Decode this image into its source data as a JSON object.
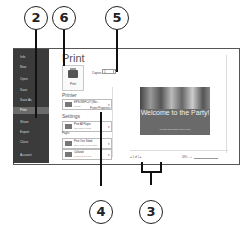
{
  "backstage": {
    "sidebar": {
      "items": [
        {
          "label": "Info",
          "active": false
        },
        {
          "label": "New",
          "active": false
        },
        {
          "label": "Open",
          "active": false
        },
        {
          "label": "Save",
          "active": false
        },
        {
          "label": "Save As",
          "active": false
        },
        {
          "label": "Print",
          "active": true
        },
        {
          "label": "Share",
          "active": false
        },
        {
          "label": "Export",
          "active": false
        },
        {
          "label": "Close",
          "active": false
        },
        {
          "label": "Account",
          "active": false
        },
        {
          "label": "Options",
          "active": false
        }
      ]
    },
    "print": {
      "title": "Print",
      "print_button_label": "Print",
      "copies_label": "Copies:",
      "copies_value": "1",
      "printer_heading": "Printer",
      "printer_name": "EPSON9FC47 (Wor...",
      "printer_status": "Ready",
      "printer_properties_link": "Printer Properties",
      "settings_heading": "Settings",
      "setting_slides": {
        "title": "Print All Pages",
        "subtitle": "The whole thing"
      },
      "pages_label": "Pages:",
      "setting_sides": {
        "title": "Print One Sided",
        "subtitle": "Only print on one side"
      },
      "setting_collate": {
        "title": "Collated",
        "subtitle": "1,2,3   1,2,3   1,2,3"
      }
    },
    "preview": {
      "slide_title": "Welcome to the Party!",
      "slide_subtitle": "Celebrate Bob's Birthday Before Friday",
      "page_nav": "◂  1  of 1  ▸",
      "zoom_text": "48%  −  +"
    }
  },
  "callouts": [
    {
      "number": "2"
    },
    {
      "number": "6"
    },
    {
      "number": "5"
    },
    {
      "number": "4"
    },
    {
      "number": "3"
    }
  ]
}
